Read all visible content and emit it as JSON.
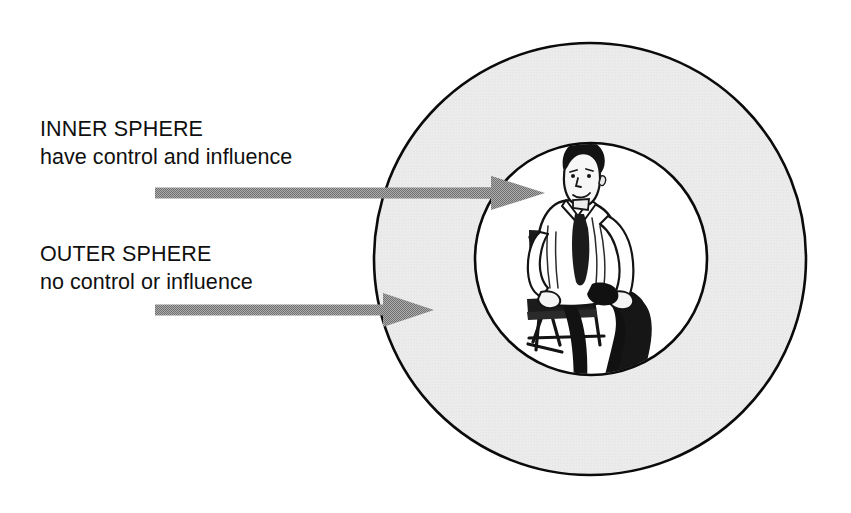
{
  "diagram": {
    "background_color": "#ffffff",
    "labels": [
      {
        "id": "inner",
        "title": "INNER SPHERE",
        "subtitle": "have control and influence"
      },
      {
        "id": "outer",
        "title": "OUTER SPHERE",
        "subtitle": "no control or influence"
      }
    ],
    "shapes": {
      "outer_circle": {
        "name": "outer-sphere",
        "fill": "#ebebeb",
        "stroke": "#000000",
        "cx": 590,
        "cy": 259,
        "r": 216
      },
      "inner_circle": {
        "name": "inner-sphere",
        "fill": "#ffffff",
        "stroke": "#000000",
        "cx": 591,
        "cy": 259,
        "r": 116
      }
    },
    "arrows": [
      {
        "id": "arrow-inner",
        "points_to": "INNER SPHERE",
        "color": "#969696",
        "y": 193,
        "shaft_start_x": 155,
        "shaft_end_x": 492,
        "tip_x": 545
      },
      {
        "id": "arrow-outer",
        "points_to": "OUTER SPHERE",
        "color": "#969696",
        "y": 310,
        "shaft_start_x": 155,
        "shaft_end_x": 383,
        "tip_x": 434
      }
    ],
    "illustration": {
      "name": "seated-man-in-directors-chair",
      "description": "Man in white shirt and dark tie seated on a folding director's chair, legs crossed",
      "shirt_color": "#ffffff",
      "trousers_color": "#101010",
      "chair_color": "#1a1a1a",
      "skin_color": "#f2f2f2"
    }
  }
}
